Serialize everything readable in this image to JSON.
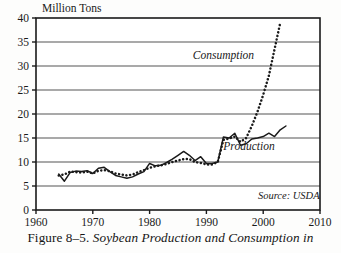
{
  "figure": {
    "caption_number": "Figure 8–5.",
    "caption_text": "Soybean Production and Consumption in",
    "caption_full": "Figure 8–5. Soybean Production and Consumption in"
  },
  "chart_data": {
    "type": "line",
    "title": "",
    "ylabel": "Million Tons",
    "xlabel": "",
    "xlim": [
      1960,
      2010
    ],
    "ylim": [
      0,
      40
    ],
    "xticks": [
      1960,
      1970,
      1980,
      1990,
      2000,
      2010
    ],
    "xtick_labels": [
      "1960",
      "1970",
      "1980",
      "1990",
      "2000",
      "2010"
    ],
    "yticks": [
      0,
      5,
      10,
      15,
      20,
      25,
      30,
      35,
      40
    ],
    "ytick_labels": [
      "0",
      "5",
      "10",
      "15",
      "20",
      "25",
      "30",
      "35",
      "40"
    ],
    "grid": "horizontal",
    "legend_position": "inline-annotations",
    "annotations": [
      {
        "name": "consumption-label",
        "text": "Consumption",
        "x": 1993.0,
        "y": 31.5
      },
      {
        "name": "production-label",
        "text": "Production",
        "x": 1997.5,
        "y": 12.6
      },
      {
        "name": "source-note",
        "text": "Source: USDA",
        "x": 2004.5,
        "y": 2.2
      }
    ],
    "series": [
      {
        "name": "Production",
        "style": "solid",
        "color": "#1a1a1a",
        "x": [
          1964,
          1965,
          1966,
          1967,
          1968,
          1969,
          1970,
          1971,
          1972,
          1973,
          1974,
          1975,
          1976,
          1977,
          1978,
          1979,
          1980,
          1981,
          1982,
          1983,
          1984,
          1985,
          1986,
          1987,
          1988,
          1989,
          1990,
          1991,
          1992,
          1993,
          1994,
          1995,
          1996,
          1997,
          1998,
          1999,
          2000,
          2001,
          2002,
          2003,
          2004
        ],
        "values": [
          7.5,
          6.0,
          7.8,
          8.1,
          8.0,
          8.2,
          7.6,
          8.7,
          8.9,
          8.0,
          7.2,
          6.9,
          6.6,
          6.9,
          7.5,
          8.0,
          9.7,
          9.2,
          9.3,
          9.9,
          10.6,
          11.4,
          12.2,
          11.4,
          10.3,
          11.1,
          9.7,
          9.7,
          10.0,
          15.2,
          15.0,
          16.0,
          13.5,
          13.8,
          14.8,
          15.0,
          15.3,
          16.0,
          15.3,
          16.7,
          17.5
        ]
      },
      {
        "name": "Consumption",
        "style": "dotted",
        "color": "#1a1a1a",
        "x": [
          1964,
          1965,
          1966,
          1967,
          1968,
          1969,
          1970,
          1971,
          1972,
          1973,
          1974,
          1975,
          1976,
          1977,
          1978,
          1979,
          1980,
          1981,
          1982,
          1983,
          1984,
          1985,
          1986,
          1987,
          1988,
          1989,
          1990,
          1991,
          1992,
          1993,
          1994,
          1995,
          1996,
          1997,
          1998,
          1999,
          2000,
          2001,
          2002,
          2003
        ],
        "values": [
          7.2,
          7.4,
          8.0,
          7.9,
          7.8,
          8.0,
          7.6,
          8.2,
          8.3,
          8.1,
          7.6,
          7.4,
          7.2,
          7.4,
          7.9,
          8.3,
          8.8,
          9.1,
          9.3,
          9.6,
          10.0,
          10.3,
          10.6,
          10.6,
          10.0,
          9.8,
          9.5,
          9.5,
          10.0,
          14.6,
          14.9,
          15.3,
          14.2,
          15.0,
          17.5,
          20.5,
          24.0,
          28.0,
          33.5,
          39.0
        ]
      }
    ]
  }
}
